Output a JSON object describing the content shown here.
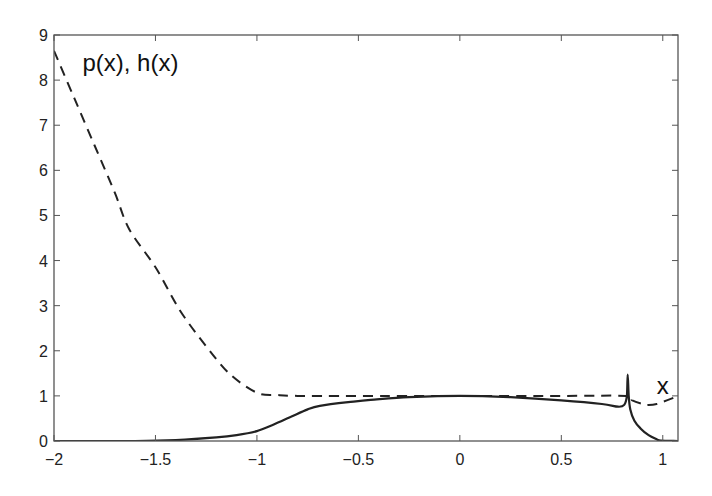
{
  "chart_data": {
    "type": "line",
    "title": "",
    "xlabel": "",
    "ylabel": "",
    "xlim": [
      -2,
      1.075
    ],
    "ylim": [
      0,
      9
    ],
    "grid": false,
    "legend": null,
    "x_ticks": [
      -2,
      -1.5,
      -1,
      -0.5,
      0,
      0.5,
      1
    ],
    "x_tick_labels": [
      "−2",
      "−1.5",
      "−1",
      "−0.5",
      "0",
      "0.5",
      "1"
    ],
    "y_ticks": [
      0,
      1,
      2,
      3,
      4,
      5,
      6,
      7,
      8,
      9
    ],
    "y_tick_labels": [
      "0",
      "1",
      "2",
      "3",
      "4",
      "5",
      "6",
      "7",
      "8",
      "9"
    ],
    "annotations": [
      {
        "text": "p(x), h(x)",
        "x": -1.86,
        "y": 8.2
      },
      {
        "text": "x",
        "x": 0.97,
        "y": 1.05
      }
    ],
    "series": [
      {
        "name": "h(x)",
        "style": "dashed",
        "color": "#222222",
        "x": [
          -2,
          -1.9,
          -1.8,
          -1.7,
          -1.63,
          -1.5,
          -1.38,
          -1.25,
          -1.13,
          -1.0,
          -0.9,
          -0.8,
          -0.5,
          0,
          0.5,
          0.82,
          0.85,
          0.9,
          0.93,
          0.97,
          1.02,
          1.075
        ],
        "y": [
          8.65,
          7.6,
          6.55,
          5.5,
          4.7,
          3.85,
          2.9,
          2.1,
          1.47,
          1.07,
          1.02,
          1.0,
          1.0,
          1.0,
          1.0,
          1.0,
          0.9,
          0.82,
          0.8,
          0.82,
          0.9,
          1.0
        ]
      },
      {
        "name": "p(x)",
        "style": "solid",
        "color": "#222222",
        "x": [
          -2,
          -1.6,
          -1.4,
          -1.2,
          -1.1,
          -1.0,
          -0.92,
          -0.84,
          -0.75,
          -0.69,
          -0.55,
          -0.44,
          -0.25,
          0,
          0.25,
          0.5,
          0.7,
          0.78,
          0.81,
          0.823,
          0.827,
          0.832,
          0.84,
          0.86,
          0.89,
          0.93,
          0.97,
          0.99,
          1.075
        ],
        "y": [
          0,
          0.0,
          0.02,
          0.08,
          0.13,
          0.22,
          0.36,
          0.52,
          0.7,
          0.78,
          0.86,
          0.91,
          0.97,
          1.0,
          0.97,
          0.9,
          0.82,
          0.76,
          0.8,
          1.0,
          1.47,
          1.0,
          0.7,
          0.45,
          0.28,
          0.13,
          0.04,
          0.01,
          0.0
        ]
      }
    ]
  }
}
